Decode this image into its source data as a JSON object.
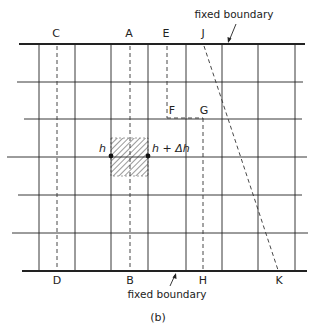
{
  "figure": {
    "caption": "(b)",
    "colors": {
      "line": "#222222",
      "background": "#ffffff",
      "hatch": "#555555"
    }
  },
  "boundaries": {
    "top_label": "fixed boundary",
    "bottom_label": "fixed boundary"
  },
  "grid": {
    "vertical_x": [
      39,
      75,
      111,
      148,
      186,
      222,
      258,
      295
    ],
    "interior_horizontal_y": [
      82,
      119,
      157,
      195,
      233
    ],
    "top_y": 44,
    "bottom_y": 271
  },
  "section_lines": [
    {
      "from": "C",
      "to": "D",
      "style": "dashed"
    },
    {
      "from": "A",
      "to": "B",
      "style": "dashed"
    },
    {
      "from": "E",
      "to": "F",
      "style": "dashed"
    },
    {
      "from": "F",
      "to": "G",
      "style": "dashed"
    },
    {
      "from": "G",
      "to": "H",
      "style": "dashed"
    },
    {
      "from": "J",
      "to": "K",
      "style": "dashed"
    }
  ],
  "labels": {
    "C": "C",
    "A": "A",
    "E": "E",
    "J": "J",
    "D": "D",
    "B": "B",
    "H": "H",
    "K": "K",
    "F": "F",
    "G": "G"
  },
  "nodes": {
    "left": "h",
    "right": "h + Δh"
  },
  "shaded_cell": {
    "description": "hatched control volume between h and h + Δh"
  }
}
